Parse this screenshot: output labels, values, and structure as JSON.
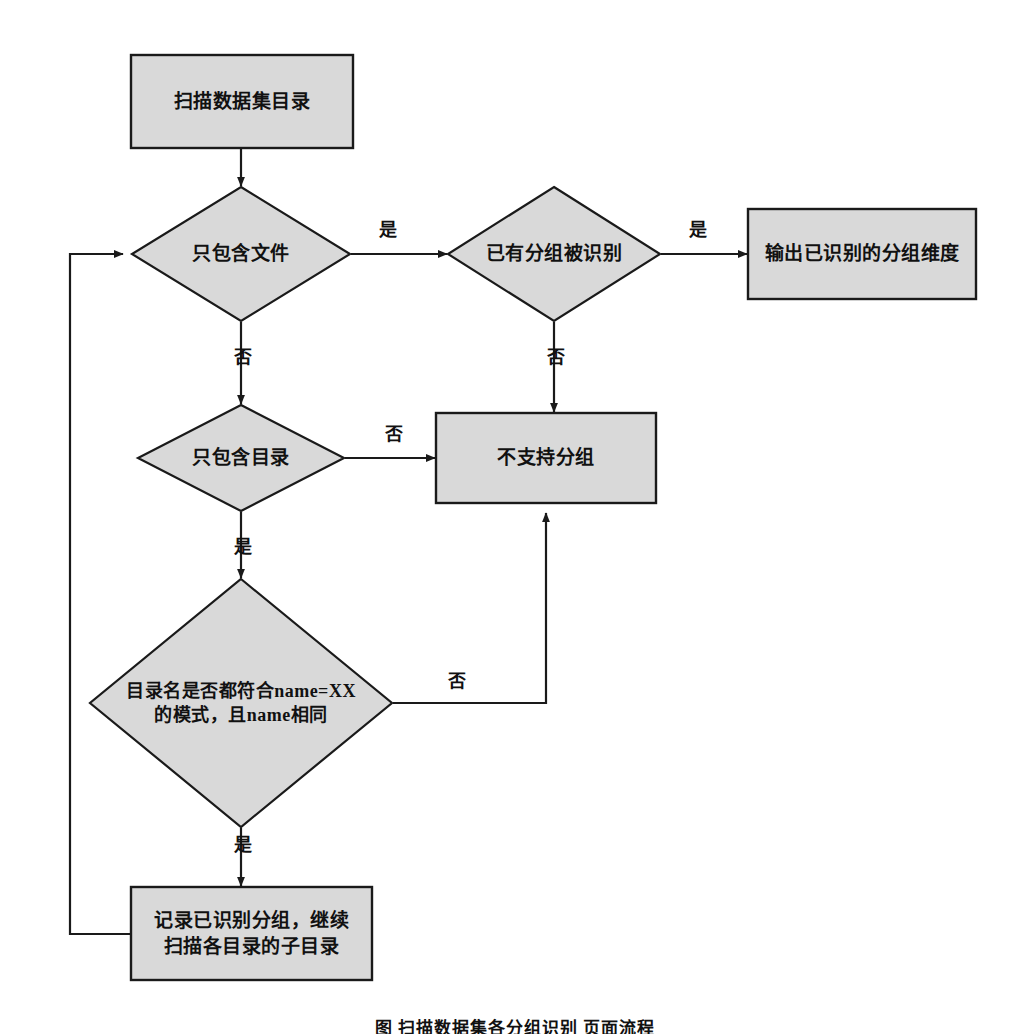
{
  "diagram": {
    "type": "flowchart",
    "background_color": "#ffffff",
    "node_fill_color": "#d9d9d9",
    "node_stroke_color": "#1a1a1a",
    "nodes": [
      {
        "id": "scan_dataset_dir",
        "shape": "process",
        "label": "扫描数据集目录"
      },
      {
        "id": "only_files",
        "shape": "decision",
        "label": "只包含文件"
      },
      {
        "id": "group_recognized",
        "shape": "decision",
        "label": "已有分组被识别"
      },
      {
        "id": "output_group_dims",
        "shape": "process",
        "label": "输出已识别的分组维度"
      },
      {
        "id": "only_dirs",
        "shape": "decision",
        "label": "只包含目录"
      },
      {
        "id": "no_group_support",
        "shape": "process",
        "label": "不支持分组"
      },
      {
        "id": "name_pattern_check",
        "shape": "decision",
        "label": "目录名是否都符合name=XX\n的模式，且name相同"
      },
      {
        "id": "record_group_continue",
        "shape": "process",
        "label": "记录已识别分组，继续\n扫描各目录的子目录"
      }
    ],
    "edges": [
      {
        "from": "scan_dataset_dir",
        "to": "only_files",
        "label": ""
      },
      {
        "from": "only_files",
        "to": "group_recognized",
        "label": "是"
      },
      {
        "from": "group_recognized",
        "to": "output_group_dims",
        "label": "是"
      },
      {
        "from": "group_recognized",
        "to": "no_group_support",
        "label": "否"
      },
      {
        "from": "only_files",
        "to": "only_dirs",
        "label": "否"
      },
      {
        "from": "only_dirs",
        "to": "no_group_support",
        "label": "否"
      },
      {
        "from": "only_dirs",
        "to": "name_pattern_check",
        "label": "是"
      },
      {
        "from": "name_pattern_check",
        "to": "no_group_support",
        "label": "否"
      },
      {
        "from": "name_pattern_check",
        "to": "record_group_continue",
        "label": "是"
      },
      {
        "from": "record_group_continue",
        "to": "only_files",
        "label": ""
      }
    ]
  },
  "caption": {
    "text": "图    扫描数据集各分组识别  页面流程"
  }
}
